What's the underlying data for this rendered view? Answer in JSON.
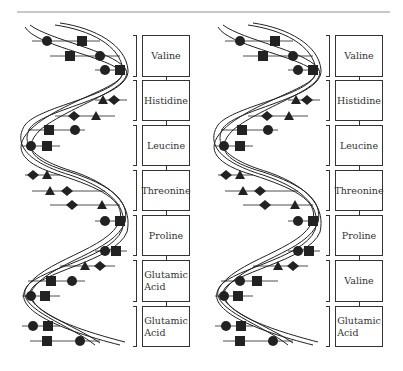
{
  "figure": {
    "panels": [
      {
        "name": "normal-hemoglobin-strand",
        "amino_acids": [
          "Valine",
          "Histidine",
          "Leucine",
          "Threonine",
          "Proline",
          "Glutamic\nAcid",
          "Glutamic\nAcid"
        ]
      },
      {
        "name": "sickle-hemoglobin-strand",
        "amino_acids": [
          "Valine",
          "Histidine",
          "Leucine",
          "Threonine",
          "Proline",
          "Valine",
          "Glutamic\nAcid"
        ]
      }
    ],
    "base_symbols": [
      "circle",
      "square",
      "triangle",
      "diamond"
    ],
    "colors": {
      "ink": "#1a1a1a",
      "rule": "#c8c8c8",
      "background": "#ffffff"
    }
  }
}
